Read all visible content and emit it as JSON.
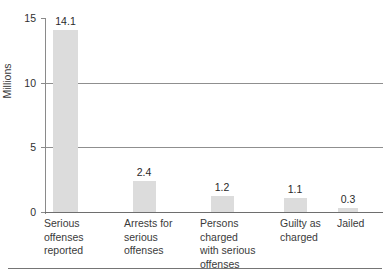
{
  "chart_data": {
    "type": "bar",
    "title": "",
    "subtitle": "",
    "xlabel": "",
    "ylabel": "Millions",
    "ylim": [
      0,
      15
    ],
    "yticks": [
      0,
      5,
      10,
      15
    ],
    "ytick_labels": [
      "0",
      "5",
      "10",
      "15"
    ],
    "grid": "horizontal",
    "gridlines_at": [
      5,
      10
    ],
    "legend": "none",
    "bar_color": "#dcdcdc",
    "categories": [
      "Serious offenses reported",
      "Arrests for serious offenses",
      "Persons charged with serious offenses",
      "Guilty as charged",
      "Jailed"
    ],
    "category_lines": [
      [
        "Serious",
        "offenses",
        "reported"
      ],
      [
        "Arrests for",
        "serious",
        "offenses"
      ],
      [
        "Persons",
        "charged",
        "with serious",
        "offenses"
      ],
      [
        "Guilty as",
        "charged"
      ],
      [
        "Jailed"
      ]
    ],
    "values": [
      14.1,
      2.4,
      1.2,
      1.1,
      0.3
    ],
    "data_labels": [
      "14.1",
      "2.4",
      "1.2",
      "1.1",
      "0.3"
    ],
    "units": "millions"
  },
  "axis": {
    "y_title": "Millions",
    "y_tick_labels": [
      "15",
      "10",
      "5",
      "0"
    ]
  }
}
